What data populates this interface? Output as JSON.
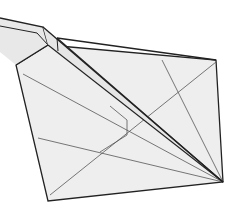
{
  "diagram": {
    "type": "origami-fold-diagram",
    "colors": {
      "background": "#ffffff",
      "paper": "#eeeeee",
      "paper_shadow": "#e4e4e4",
      "edge": "#222222",
      "crease": "#555555"
    },
    "paper_polygon": [
      [
        48,
        45
      ],
      [
        216,
        60
      ],
      [
        223,
        182
      ],
      [
        48,
        201
      ],
      [
        16,
        65
      ]
    ],
    "flap": [
      [
        0,
        20
      ],
      [
        43,
        27
      ],
      [
        48,
        45
      ],
      [
        16,
        65
      ],
      [
        0,
        52
      ]
    ],
    "flap_inner": [
      [
        0,
        28
      ],
      [
        40,
        34
      ],
      [
        48,
        45
      ]
    ],
    "fold_strip": [
      [
        43,
        27
      ],
      [
        57,
        38
      ],
      [
        223,
        182
      ],
      [
        214,
        182
      ],
      [
        48,
        45
      ]
    ],
    "creases": [
      [
        [
          23,
          74
        ],
        [
          223,
          182
        ]
      ],
      [
        [
          38,
          141
        ],
        [
          223,
          182
        ]
      ],
      [
        [
          57,
          38
        ],
        [
          223,
          182
        ]
      ],
      [
        [
          162,
          60
        ],
        [
          223,
          182
        ]
      ],
      [
        [
          216,
          62
        ],
        [
          50,
          195
        ]
      ],
      [
        [
          125,
          120
        ],
        [
          125,
          137
        ]
      ],
      [
        [
          125,
          137
        ],
        [
          100,
          150
        ]
      ],
      [
        [
          125,
          120
        ],
        [
          110,
          107
        ]
      ]
    ]
  }
}
